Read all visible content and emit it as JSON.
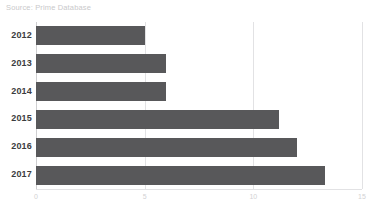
{
  "source_note": "Source: Prime Database",
  "colors": {
    "bar": "#58585a",
    "gridline": "#e2e2e4",
    "axis": "#cfcfd1",
    "category_label": "#3c3c3e",
    "tick_label": "#d2d2d4",
    "source_note": "#c9c9cb",
    "background": "#ffffff"
  },
  "chart_data": {
    "type": "bar",
    "orientation": "horizontal",
    "title": "",
    "subtitle": "",
    "xlabel": "",
    "ylabel": "",
    "categories": [
      "2012",
      "2013",
      "2014",
      "2015",
      "2016",
      "2017"
    ],
    "values": [
      5,
      6,
      6,
      11.2,
      12,
      13.3
    ],
    "xlim": [
      0,
      15
    ],
    "xticks": [
      0,
      5,
      10,
      15
    ],
    "xtick_labels": [
      "0",
      "5",
      "10",
      "15"
    ],
    "grid": true,
    "grid_axis": "x",
    "legend": false,
    "legend_position": "none",
    "annotations": [
      "Source: Prime Database"
    ],
    "series": [
      {
        "name": "",
        "values": [
          5,
          6,
          6,
          11.2,
          12,
          13.3
        ]
      }
    ]
  }
}
